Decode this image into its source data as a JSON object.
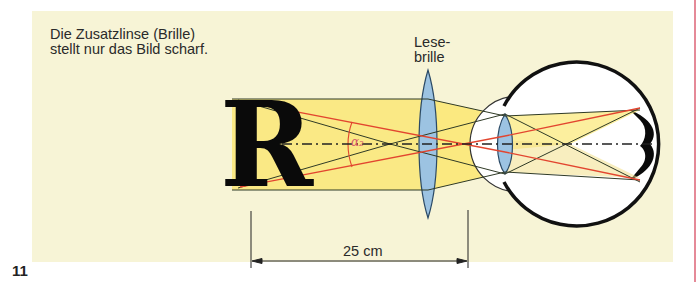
{
  "caption": {
    "line1": "Die Zusatzlinse (Brille)",
    "line2": "stellt nur das Bild scharf."
  },
  "lens_label": {
    "line1": "Lese-",
    "line2": "brille"
  },
  "object_letter": "R",
  "angle_label": "α₂",
  "dimension": {
    "label": "25 cm"
  },
  "page_number": "11",
  "colors": {
    "background_panel": "#f7f4d6",
    "light_beam": "#fbe66a",
    "lens_fill": "#9cc3e2",
    "ray_red": "#e2452f",
    "ray_dark": "#2f3a26",
    "eye_outline": "#111111",
    "margin_rule": "#e58a98"
  }
}
